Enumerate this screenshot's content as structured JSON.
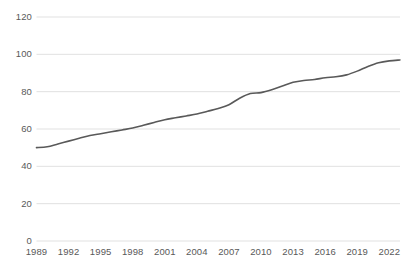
{
  "chart_data": {
    "type": "line",
    "title": "",
    "xlabel": "",
    "ylabel": "",
    "xlim": [
      1989,
      2023
    ],
    "ylim": [
      0,
      120
    ],
    "grid": true,
    "legend": false,
    "line_color": "#595959",
    "gridline_color": "#d9d9d9",
    "tick_label_color": "#595959",
    "background_color": "#ffffff",
    "y_ticks": [
      0,
      20,
      40,
      60,
      80,
      100,
      120
    ],
    "y_tick_labels": [
      "0",
      "20",
      "40",
      "60",
      "80",
      "100",
      "120"
    ],
    "x_ticks": [
      1989,
      1992,
      1995,
      1998,
      2001,
      2004,
      2007,
      2010,
      2013,
      2016,
      2019,
      2022
    ],
    "x_tick_labels": [
      "1989",
      "1992",
      "1995",
      "1998",
      "2001",
      "2004",
      "2007",
      "2010",
      "2013",
      "2016",
      "2019",
      "2022"
    ],
    "series": [
      {
        "name": "series-1",
        "x": [
          1989,
          1990,
          1991,
          1992,
          1993,
          1994,
          1995,
          1996,
          1997,
          1998,
          1999,
          2000,
          2001,
          2002,
          2003,
          2004,
          2005,
          2006,
          2007,
          2008,
          2009,
          2010,
          2011,
          2012,
          2013,
          2014,
          2015,
          2016,
          2017,
          2018,
          2019,
          2020,
          2021,
          2022,
          2023
        ],
        "values": [
          50,
          50.5,
          52,
          53.5,
          55,
          56.5,
          57.5,
          58.5,
          59.5,
          60.5,
          62,
          63.5,
          65,
          66,
          67,
          68,
          69.5,
          71,
          73,
          76.5,
          79,
          79.5,
          81,
          83,
          85,
          86,
          86.5,
          87.5,
          88,
          89,
          91,
          93.5,
          95.5,
          96.5,
          97
        ]
      }
    ]
  }
}
